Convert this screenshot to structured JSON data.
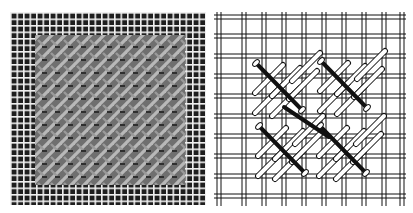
{
  "figure": {
    "panels": [
      {
        "id": "photo",
        "description": "Photograph of stitched needlepoint canvas sample",
        "canvas_color": "#1e1e1e",
        "thread_color": "#f2f2f2",
        "stitch_fill_color": "#8a8a8a",
        "grid_pitch_px": 6.5
      },
      {
        "id": "diagram",
        "description": "Line diagram of diagonal stitch clusters on double-thread canvas",
        "line_color": "#111111",
        "background": "#ffffff",
        "grid_pitch_px": 20,
        "stitch_groups": 4
      }
    ]
  }
}
